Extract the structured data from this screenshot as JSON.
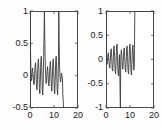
{
  "figure": {
    "type": "line-plot-pair",
    "background": "#fdfdfd",
    "line_color": "#3a3a3a",
    "axis_color": "#4a4a4a"
  },
  "chart_data": [
    {
      "type": "line",
      "name": "left-plot",
      "title": "",
      "xlabel": "",
      "ylabel": "",
      "xlim": [
        0,
        20
      ],
      "ylim": [
        -0.5,
        1
      ],
      "xticks": [
        0,
        10,
        20
      ],
      "xticklabels": [
        "0",
        "10",
        "20"
      ],
      "yticks": [
        -0.5,
        0,
        0.5,
        1
      ],
      "yticklabels": [
        "-0.5",
        "0",
        "0.5",
        "1"
      ],
      "grid": false,
      "legend": null,
      "series": [
        {
          "name": "signal",
          "x": [
            0.0,
            0.18,
            0.36,
            0.55,
            0.73,
            0.9,
            1.1,
            1.3,
            1.5,
            1.7,
            1.9,
            2.1,
            2.3,
            2.5,
            2.7,
            2.9,
            3.1,
            3.3,
            3.5,
            3.7,
            3.9,
            4.1,
            4.3,
            4.5,
            4.7,
            4.9,
            5.1,
            5.3,
            5.5,
            5.7,
            5.85,
            5.95,
            6.0,
            6.05,
            6.15,
            6.3,
            6.5,
            6.7,
            6.9,
            7.1,
            7.3,
            7.5,
            7.7,
            7.9,
            8.1,
            8.3,
            8.5,
            8.7,
            8.9,
            9.1,
            9.3,
            9.5,
            9.7,
            9.9,
            10.1,
            10.3,
            10.5,
            10.7,
            10.9,
            11.1,
            11.3,
            11.5,
            11.7,
            11.85,
            11.95,
            12.0,
            12.05,
            12.15,
            12.3,
            12.5,
            12.7,
            12.9,
            13.1,
            13.3,
            13.5,
            13.7,
            13.9,
            14.0,
            20.0
          ],
          "y": [
            1.0,
            0.46,
            0.1,
            -0.08,
            -0.05,
            0.08,
            0.12,
            0.02,
            -0.12,
            -0.14,
            -0.02,
            0.14,
            0.2,
            0.06,
            -0.16,
            -0.22,
            -0.06,
            0.18,
            0.26,
            0.1,
            -0.18,
            -0.28,
            -0.08,
            0.22,
            0.3,
            0.12,
            -0.2,
            -0.3,
            -0.1,
            0.3,
            0.62,
            0.88,
            1.0,
            0.9,
            0.6,
            0.28,
            0.02,
            -0.12,
            -0.08,
            0.06,
            0.14,
            0.04,
            -0.12,
            -0.16,
            -0.02,
            0.16,
            0.22,
            0.06,
            -0.18,
            -0.24,
            -0.06,
            0.2,
            0.26,
            0.08,
            -0.2,
            -0.28,
            -0.08,
            0.22,
            0.3,
            0.12,
            -0.2,
            -0.3,
            -0.12,
            0.3,
            0.7,
            1.0,
            0.88,
            0.5,
            0.18,
            -0.02,
            -0.1,
            -0.06,
            0.04,
            0.0,
            -0.04,
            -0.3,
            -0.44,
            -0.5,
            -0.5
          ]
        }
      ]
    },
    {
      "type": "line",
      "name": "right-plot",
      "title": "",
      "xlabel": "",
      "ylabel": "",
      "xlim": [
        0,
        20
      ],
      "ylim": [
        -1,
        1
      ],
      "xticks": [
        0,
        10,
        20
      ],
      "xticklabels": [
        "0",
        "10",
        "20"
      ],
      "yticks": [
        -1,
        -0.5,
        0,
        0.5,
        1
      ],
      "yticklabels": [
        "-1",
        "-0.5",
        "0",
        "0.5",
        "1"
      ],
      "grid": false,
      "legend": null,
      "series": [
        {
          "name": "signal",
          "x": [
            0.0,
            0.05,
            0.2,
            0.4,
            0.6,
            0.8,
            1.0,
            1.2,
            1.4,
            1.6,
            1.8,
            2.0,
            2.2,
            2.4,
            2.6,
            2.8,
            3.0,
            3.2,
            3.4,
            3.6,
            3.8,
            4.0,
            4.2,
            4.4,
            4.6,
            4.8,
            5.0,
            5.2,
            5.4,
            5.6,
            5.8,
            5.9,
            6.0,
            6.05,
            6.1,
            6.2,
            6.4,
            6.6,
            6.8,
            7.0,
            7.2,
            7.4,
            7.6,
            7.8,
            8.0,
            8.2,
            8.4,
            8.6,
            8.8,
            9.0,
            9.2,
            9.4,
            9.6,
            9.8,
            10.0,
            10.2,
            10.4,
            10.6,
            10.8,
            11.0,
            11.2,
            11.4,
            11.6,
            11.8,
            11.9,
            12.0,
            12.05,
            12.1,
            20.0
          ],
          "y": [
            1.0,
            0.62,
            0.12,
            -0.1,
            -0.04,
            0.1,
            0.14,
            0.0,
            -0.16,
            -0.18,
            -0.02,
            0.18,
            0.22,
            0.04,
            -0.2,
            -0.24,
            -0.04,
            0.22,
            0.28,
            0.06,
            -0.24,
            -0.3,
            -0.06,
            0.26,
            0.32,
            0.08,
            -0.26,
            -0.34,
            -0.1,
            0.1,
            -0.4,
            -0.8,
            -1.0,
            -0.8,
            -0.3,
            0.08,
            0.2,
            0.06,
            -0.14,
            -0.2,
            -0.04,
            0.18,
            0.24,
            0.04,
            -0.2,
            -0.26,
            -0.06,
            0.22,
            0.28,
            0.06,
            -0.24,
            -0.3,
            -0.08,
            0.26,
            0.32,
            0.1,
            -0.24,
            -0.32,
            -0.1,
            0.24,
            0.3,
            0.08,
            -0.22,
            -0.1,
            0.4,
            1.0,
            1.0,
            1.0,
            1.0
          ]
        }
      ]
    }
  ]
}
